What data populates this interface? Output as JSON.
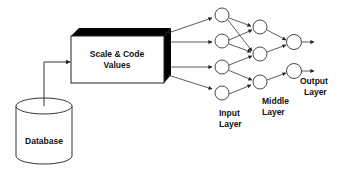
{
  "diagram": {
    "database": {
      "label": "Database"
    },
    "process_box": {
      "line1": "Scale & Code",
      "line2": "Values"
    },
    "layers": {
      "input": {
        "line1": "Input",
        "line2": "Layer"
      },
      "middle": {
        "line1": "Middle",
        "line2": "Layer"
      },
      "output": {
        "line1": "Output",
        "line2": "Layer"
      }
    },
    "colors": {
      "stroke": "#222222",
      "box_top": "#000000",
      "background": "#ffffff"
    }
  }
}
